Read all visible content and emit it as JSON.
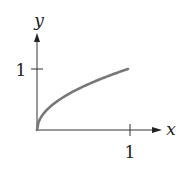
{
  "chart_data": {
    "type": "line",
    "title": "",
    "xlabel": "x",
    "ylabel": "y",
    "x_ticks": [
      "1"
    ],
    "y_ticks": [
      "1"
    ],
    "xlim": [
      0,
      1.1
    ],
    "ylim": [
      0,
      1.5
    ],
    "grid": false,
    "legend": null,
    "series": [
      {
        "name": "y = sqrt(x)",
        "x": [
          0,
          0.05,
          0.1,
          0.2,
          0.3,
          0.4,
          0.5,
          0.6,
          0.7,
          0.8,
          0.9,
          1.0
        ],
        "values": [
          0,
          0.22,
          0.32,
          0.45,
          0.55,
          0.63,
          0.71,
          0.77,
          0.84,
          0.89,
          0.95,
          1.0
        ]
      }
    ]
  },
  "colors": {
    "curve": "#777777",
    "axes": "#333333"
  }
}
